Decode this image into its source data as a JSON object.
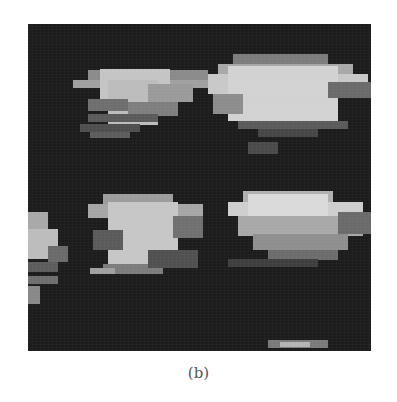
{
  "figure": {
    "caption": "(b)",
    "panel": {
      "x": 28,
      "y": 24,
      "width": 343,
      "height": 327,
      "background": "#1c1c1c"
    },
    "blocks": [
      {
        "x": 60,
        "y": 46,
        "w": 120,
        "h": 10,
        "c": "#8a8a8a"
      },
      {
        "x": 45,
        "y": 56,
        "w": 150,
        "h": 8,
        "c": "#a0a0a0"
      },
      {
        "x": 72,
        "y": 45,
        "w": 70,
        "h": 30,
        "c": "#c4c4c4"
      },
      {
        "x": 80,
        "y": 56,
        "w": 50,
        "h": 45,
        "c": "#bcbcbc"
      },
      {
        "x": 120,
        "y": 60,
        "w": 45,
        "h": 18,
        "c": "#9a9a9a"
      },
      {
        "x": 60,
        "y": 75,
        "w": 40,
        "h": 12,
        "c": "#6e6e6e"
      },
      {
        "x": 100,
        "y": 78,
        "w": 50,
        "h": 14,
        "c": "#7e7e7e"
      },
      {
        "x": 60,
        "y": 90,
        "w": 70,
        "h": 8,
        "c": "#5a5a5a"
      },
      {
        "x": 52,
        "y": 100,
        "w": 60,
        "h": 8,
        "c": "#4e4e4e"
      },
      {
        "x": 62,
        "y": 108,
        "w": 40,
        "h": 6,
        "c": "#5c5c5c"
      },
      {
        "x": 205,
        "y": 30,
        "w": 95,
        "h": 10,
        "c": "#7c7c7c"
      },
      {
        "x": 190,
        "y": 40,
        "w": 135,
        "h": 10,
        "c": "#a8a8a8"
      },
      {
        "x": 180,
        "y": 50,
        "w": 160,
        "h": 20,
        "c": "#c8c8c8"
      },
      {
        "x": 200,
        "y": 42,
        "w": 110,
        "h": 55,
        "c": "#d2d2d2"
      },
      {
        "x": 300,
        "y": 58,
        "w": 43,
        "h": 16,
        "c": "#6a6a6a"
      },
      {
        "x": 185,
        "y": 70,
        "w": 30,
        "h": 20,
        "c": "#8c8c8c"
      },
      {
        "x": 210,
        "y": 97,
        "w": 110,
        "h": 8,
        "c": "#5a5a5a"
      },
      {
        "x": 230,
        "y": 105,
        "w": 60,
        "h": 8,
        "c": "#464646"
      },
      {
        "x": 220,
        "y": 118,
        "w": 30,
        "h": 12,
        "c": "#4a4a4a"
      },
      {
        "x": 75,
        "y": 170,
        "w": 70,
        "h": 14,
        "c": "#9c9c9c"
      },
      {
        "x": 60,
        "y": 180,
        "w": 115,
        "h": 14,
        "c": "#a6a6a6"
      },
      {
        "x": 80,
        "y": 178,
        "w": 70,
        "h": 62,
        "c": "#c6c6c6"
      },
      {
        "x": 145,
        "y": 192,
        "w": 30,
        "h": 22,
        "c": "#707070"
      },
      {
        "x": 65,
        "y": 206,
        "w": 30,
        "h": 20,
        "c": "#5a5a5a"
      },
      {
        "x": 75,
        "y": 240,
        "w": 60,
        "h": 10,
        "c": "#7c7c7c"
      },
      {
        "x": 62,
        "y": 244,
        "w": 25,
        "h": 6,
        "c": "#a0a0a0"
      },
      {
        "x": 120,
        "y": 226,
        "w": 50,
        "h": 18,
        "c": "#505050"
      },
      {
        "x": 0,
        "y": 188,
        "w": 20,
        "h": 32,
        "c": "#a8a8a8"
      },
      {
        "x": 0,
        "y": 205,
        "w": 30,
        "h": 30,
        "c": "#bcbcbc"
      },
      {
        "x": 20,
        "y": 222,
        "w": 20,
        "h": 16,
        "c": "#6a6a6a"
      },
      {
        "x": 0,
        "y": 238,
        "w": 30,
        "h": 10,
        "c": "#5c5c5c"
      },
      {
        "x": 0,
        "y": 252,
        "w": 30,
        "h": 8,
        "c": "#6e6e6e"
      },
      {
        "x": 0,
        "y": 262,
        "w": 12,
        "h": 18,
        "c": "#888888"
      },
      {
        "x": 215,
        "y": 167,
        "w": 90,
        "h": 12,
        "c": "#b0b0b0"
      },
      {
        "x": 200,
        "y": 178,
        "w": 135,
        "h": 14,
        "c": "#cecece"
      },
      {
        "x": 220,
        "y": 170,
        "w": 80,
        "h": 30,
        "c": "#dadada"
      },
      {
        "x": 210,
        "y": 192,
        "w": 125,
        "h": 20,
        "c": "#a8a8a8"
      },
      {
        "x": 225,
        "y": 210,
        "w": 95,
        "h": 16,
        "c": "#8e8e8e"
      },
      {
        "x": 240,
        "y": 226,
        "w": 70,
        "h": 10,
        "c": "#6c6c6c"
      },
      {
        "x": 200,
        "y": 235,
        "w": 90,
        "h": 8,
        "c": "#3e3e3e"
      },
      {
        "x": 310,
        "y": 188,
        "w": 33,
        "h": 22,
        "c": "#6a6a6a"
      },
      {
        "x": 240,
        "y": 316,
        "w": 60,
        "h": 8,
        "c": "#7a7a7a"
      },
      {
        "x": 252,
        "y": 318,
        "w": 30,
        "h": 5,
        "c": "#b4b4b4"
      }
    ]
  }
}
